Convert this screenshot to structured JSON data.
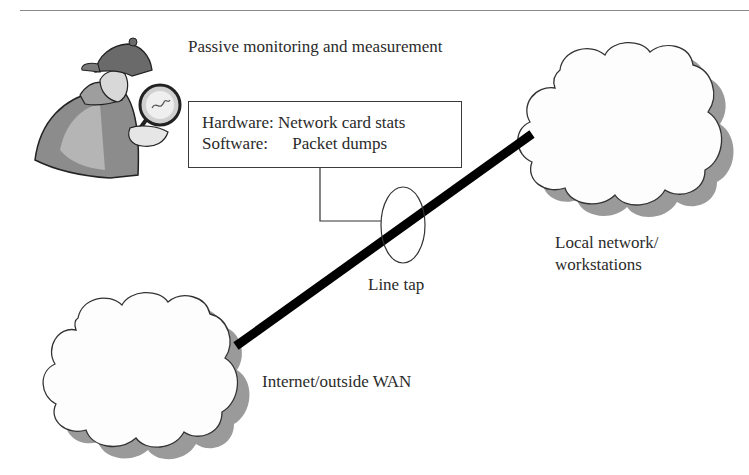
{
  "diagram": {
    "title": "Passive monitoring and measurement",
    "info_box": {
      "rows": [
        {
          "key": "Hardware:",
          "value": "Network card stats"
        },
        {
          "key": "Software:",
          "value": "Packet dumps"
        }
      ]
    },
    "line_tap_label": "Line tap",
    "local_network": {
      "line1": "Local network/",
      "line2": "workstations"
    },
    "wan_label": "Internet/outside WAN",
    "icons": {
      "detective": "detective-with-magnifying-glass",
      "cloud_local": "cloud",
      "cloud_wan": "cloud",
      "tap": "ellipse"
    },
    "colors": {
      "link_line": "#000000",
      "cloud_fill": "#ffffff",
      "cloud_shadow": "#9a9a9a",
      "outline": "#333333"
    }
  }
}
